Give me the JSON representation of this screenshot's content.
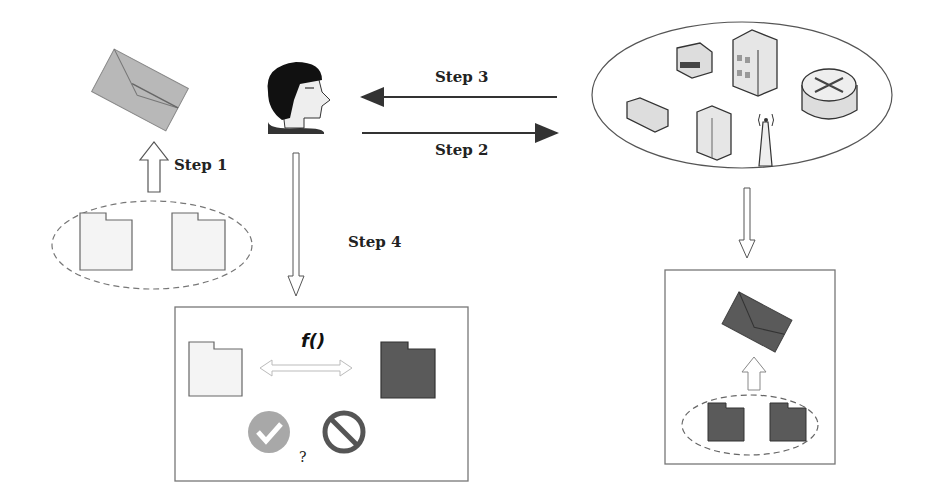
{
  "labels": {
    "step1": "Step 1",
    "step2": "Step 2",
    "step3": "Step 3",
    "step4": "Step 4",
    "function": "f()",
    "question": "?"
  },
  "nodes": {
    "left_envelope": {
      "icon": "envelope-icon",
      "color": "#b4b4b4"
    },
    "left_files": {
      "icons": [
        "document-icon",
        "document-icon"
      ],
      "color": "#f4f4f4",
      "group": "dashed-ellipse"
    },
    "user": {
      "icon": "user-head-icon"
    },
    "network_cloud": {
      "icons": [
        "printer-icon",
        "building-server-icon",
        "router-icon",
        "switch-icon",
        "server-tower-icon",
        "wireless-antenna-icon"
      ],
      "group": "ellipse"
    },
    "compare_box": {
      "left_file_color": "#f4f4f4",
      "right_file_color": "#5a5a5a",
      "accept_icon": "check-circle-icon",
      "reject_icon": "prohibited-icon"
    },
    "right_box": {
      "envelope_color": "#5a5a5a",
      "file_color": "#5a5a5a"
    }
  },
  "colors": {
    "dark": "#5a5a5a",
    "light": "#f4f4f4",
    "grey": "#b4b4b4",
    "line": "#333333"
  }
}
